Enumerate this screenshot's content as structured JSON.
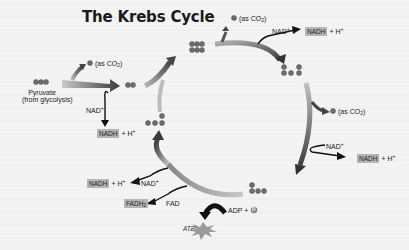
{
  "title": "The Krebs Cycle",
  "colors": {
    "arrow_dark": "#2e2e2e",
    "arrow_light": "#a8a8a8",
    "carbon_fill": "#6e6e6e",
    "highlight_box": "#b5b5b5",
    "background": "#f2f2f2"
  },
  "pyruvate": {
    "carbons": "C-C-C",
    "label_line1": "Pyruvate",
    "label_line2": "(from glycolysis)"
  },
  "steps": {
    "co2_1": {
      "carbon": "C",
      "label": "(as CO",
      "sub": "2",
      "close": ")"
    },
    "acetyl": {
      "carbons": "C-C"
    },
    "nad_1": {
      "label": "NAD",
      "sup": "+"
    },
    "nadh_1": {
      "box": "NADH",
      "rest": "+ H",
      "sup": "+"
    },
    "citrate": {
      "carbons": "C-C-C / C-C-C"
    },
    "co2_2": {
      "carbon": "C",
      "label": "(as CO",
      "sub": "2",
      "close": ")"
    },
    "nad_2": {
      "label": "NAD",
      "sup": "+"
    },
    "nadh_2": {
      "box": "NADH",
      "rest": "+ H",
      "sup": "+"
    },
    "five_carbon": {
      "carbons": "C C / C-C-C"
    },
    "co2_3": {
      "carbon": "C",
      "label": "(as CO",
      "sub": "2",
      "close": ")"
    },
    "nad_3": {
      "label": "NAD",
      "sup": "+"
    },
    "nadh_3": {
      "box": "NADH",
      "rest": "+ H",
      "sup": "+"
    },
    "four_carbon_a": {
      "carbons": "C / C-C-C"
    },
    "adp": {
      "label": "ADP +",
      "p": "P"
    },
    "atp": {
      "label": "ATP"
    },
    "fad": {
      "label": "FAD"
    },
    "fadh2": {
      "box": "FADH",
      "sub": "2"
    },
    "nad_4": {
      "label": "NAD",
      "sup": "+"
    },
    "nadh_4": {
      "box": "NADH",
      "rest": "+ H",
      "sup": "+"
    },
    "four_carbon_b": {
      "carbons": "C / C-C-C"
    }
  }
}
